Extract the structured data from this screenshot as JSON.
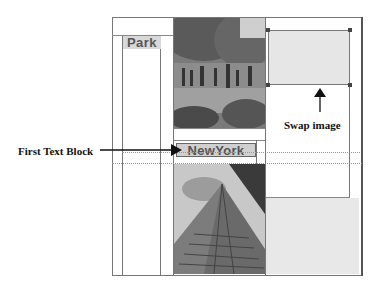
{
  "layout": {
    "blocks": {
      "park_label": "Park",
      "newyork_label": "NewYork"
    }
  },
  "annotations": {
    "first_text_block": "First Text Block",
    "swap_image": "Swap image"
  },
  "colors": {
    "frame": "#777777",
    "text_block_bg": "#d0d0d0",
    "swap_placeholder": "#e6e6e6",
    "annotation_text": "#111111"
  }
}
